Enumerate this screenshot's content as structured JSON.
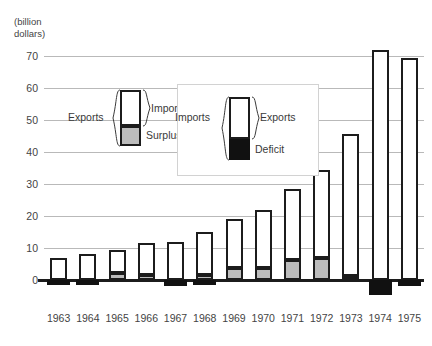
{
  "chart_data": {
    "type": "bar",
    "title": "",
    "subtitle": "",
    "xlabel": "",
    "ylabel": "(billion dollars)",
    "ylim": [
      -5,
      75
    ],
    "yticks": [
      0,
      10,
      20,
      30,
      40,
      50,
      60,
      70
    ],
    "grid": true,
    "categories": [
      "1963",
      "1964",
      "1965",
      "1966",
      "1967",
      "1968",
      "1969",
      "1970",
      "1971",
      "1972",
      "1973",
      "1974",
      "1975"
    ],
    "series": [
      {
        "name": "Imports",
        "values": [
          7.0,
          8.2,
          9.5,
          11.5,
          12.0,
          15.0,
          19.0,
          21.8,
          28.3,
          34.5,
          45.5,
          72.0,
          69.5
        ]
      },
      {
        "name": "Surplus",
        "values": [
          0.0,
          0.0,
          2.2,
          1.6,
          0.0,
          1.5,
          3.8,
          3.8,
          6.2,
          6.8,
          1.2,
          0.0,
          0.0
        ]
      },
      {
        "name": "Deficit",
        "values": [
          -1.6,
          -1.6,
          0.0,
          0.0,
          -2.0,
          -1.5,
          0.0,
          0.0,
          0.0,
          0.0,
          0.0,
          -4.8,
          -2.0
        ]
      }
    ]
  },
  "axis": {
    "unit_label_line1": "(billion",
    "unit_label_line2": "dollars)",
    "ytick_labels": [
      "0",
      "10",
      "20",
      "30",
      "40",
      "50",
      "60",
      "70"
    ]
  },
  "legend_surplus": {
    "left_bracket_label": "Exports",
    "top_label": "Imports",
    "bottom_label": "Surplus"
  },
  "legend_deficit": {
    "left_bracket_label": "Imports",
    "right_bracket_label": "Exports",
    "bottom_label": "Deficit"
  },
  "colors": {
    "imports_fill": "#ffffff",
    "surplus_fill": "#bcbcbc",
    "deficit_fill": "#111111",
    "outline": "#1c1c1c",
    "gridline": "#b9b9b9",
    "text": "#3a3a3a",
    "background": "#ffffff"
  }
}
